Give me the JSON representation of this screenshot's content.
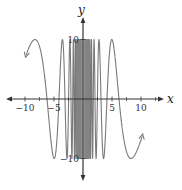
{
  "chart_data": {
    "type": "line",
    "title": "",
    "function_approx": "y = 10 sin(39/x)",
    "xlabel": "x",
    "ylabel": "y",
    "xlim": [
      -13,
      15
    ],
    "ylim": [
      -13,
      13
    ],
    "x_ticks": [
      -10,
      -5,
      5,
      10
    ],
    "x_tick_labels": [
      "−10",
      "−5",
      "5",
      "10"
    ],
    "y_ticks": [
      10,
      -10
    ],
    "y_tick_labels": [
      "10",
      "−10"
    ],
    "grid": false,
    "legend": null,
    "series": [
      {
        "name": "curve",
        "color": "#7a7a7a",
        "amplitude": 10,
        "k": 39,
        "domain": [
          -9.8,
          10.2
        ],
        "key_points": [
          {
            "x": -9.8,
            "y": 6.5,
            "note": "arrow end"
          },
          {
            "x": -7.9,
            "y": 10
          },
          {
            "x": -6.0,
            "y": 0
          },
          {
            "x": -4.8,
            "y": -10
          },
          {
            "x": -3.3,
            "y": 10
          },
          {
            "x": 3.4,
            "y": -10
          },
          {
            "x": 5.0,
            "y": 10
          },
          {
            "x": 6.2,
            "y": 0
          },
          {
            "x": 8.6,
            "y": -10
          },
          {
            "x": 10.2,
            "y": -6.3,
            "note": "arrow end"
          }
        ]
      }
    ]
  }
}
